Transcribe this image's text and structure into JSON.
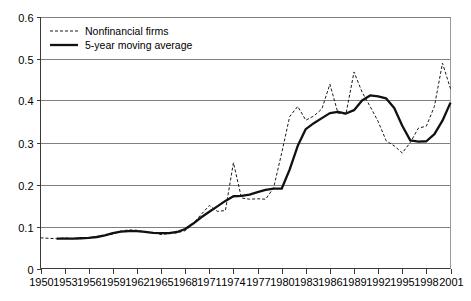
{
  "chart_data": {
    "type": "line",
    "title": "",
    "xlabel": "",
    "ylabel": "",
    "xlim": [
      1950,
      2001
    ],
    "ylim": [
      0,
      0.6
    ],
    "grid": true,
    "legend_position": "top-left",
    "y_ticks": [
      "0",
      "0.1",
      "0.2",
      "0.3",
      "0.4",
      "0.5",
      "0.6"
    ],
    "y_tick_values": [
      0,
      0.1,
      0.2,
      0.3,
      0.4,
      0.5,
      0.6
    ],
    "x_ticks": [
      "1950",
      "1953",
      "1956",
      "1959",
      "1962",
      "1965",
      "1968",
      "1971",
      "1974",
      "1977",
      "1980",
      "1983",
      "1986",
      "1989",
      "1992",
      "1995",
      "1998",
      "2001"
    ],
    "x_tick_values": [
      1950,
      1953,
      1956,
      1959,
      1962,
      1965,
      1968,
      1971,
      1974,
      1977,
      1980,
      1983,
      1986,
      1989,
      1992,
      1995,
      1998,
      2001
    ],
    "x": [
      1950,
      1951,
      1952,
      1953,
      1954,
      1955,
      1956,
      1957,
      1958,
      1959,
      1960,
      1961,
      1962,
      1963,
      1964,
      1965,
      1966,
      1967,
      1968,
      1969,
      1970,
      1971,
      1972,
      1973,
      1974,
      1975,
      1976,
      1977,
      1978,
      1979,
      1980,
      1981,
      1982,
      1983,
      1984,
      1985,
      1986,
      1987,
      1988,
      1989,
      1990,
      1991,
      1992,
      1993,
      1994,
      1995,
      1996,
      1997,
      1998,
      1999,
      2000,
      2001
    ],
    "series": [
      {
        "name": "Nonfinancial firms",
        "style": "dashed",
        "color": "#1a1a1a",
        "values": [
          0.073,
          0.072,
          0.071,
          0.073,
          0.071,
          0.071,
          0.073,
          0.076,
          0.079,
          0.082,
          0.089,
          0.092,
          0.091,
          0.087,
          0.085,
          0.081,
          0.083,
          0.085,
          0.09,
          0.107,
          0.129,
          0.15,
          0.136,
          0.138,
          0.252,
          0.168,
          0.165,
          0.166,
          0.165,
          0.192,
          0.275,
          0.362,
          0.386,
          0.353,
          0.363,
          0.38,
          0.439,
          0.37,
          0.368,
          0.468,
          0.42,
          0.386,
          0.35,
          0.304,
          0.292,
          0.275,
          0.3,
          0.334,
          0.339,
          0.386,
          0.489,
          0.428
        ]
      },
      {
        "name": "5-year moving average",
        "style": "solid",
        "color": "#111111",
        "values": [
          null,
          null,
          0.071,
          0.071,
          0.071,
          0.072,
          0.073,
          0.075,
          0.079,
          0.084,
          0.088,
          0.089,
          0.089,
          0.087,
          0.085,
          0.084,
          0.084,
          0.087,
          0.094,
          0.107,
          0.122,
          0.135,
          0.148,
          0.161,
          0.172,
          0.173,
          0.176,
          0.182,
          0.187,
          0.19,
          0.19,
          0.236,
          0.292,
          0.332,
          0.346,
          0.358,
          0.37,
          0.373,
          0.369,
          0.377,
          0.4,
          0.412,
          0.41,
          0.405,
          0.382,
          0.34,
          0.305,
          0.302,
          0.303,
          0.32,
          0.352,
          0.395
        ]
      }
    ]
  }
}
